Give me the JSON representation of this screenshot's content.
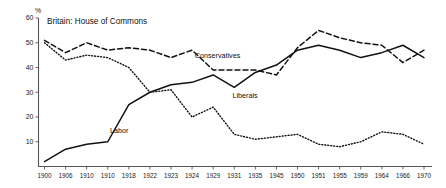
{
  "chart_data": {
    "type": "line",
    "title": "Britain: House of Commons",
    "xlabel": "",
    "ylabel": "%",
    "ylim": [
      0,
      60
    ],
    "yticks": [
      10,
      20,
      30,
      40,
      50,
      60
    ],
    "grid": false,
    "legend_position": "inline-annotations",
    "categories": [
      "1900",
      "1906",
      "1910",
      "1910",
      "1918",
      "1922",
      "1923",
      "1924",
      "1929",
      "1931",
      "1935",
      "1945",
      "1950",
      "1951",
      "1955",
      "1959",
      "1964",
      "1966",
      "1970"
    ],
    "series": [
      {
        "name": "Conservatives",
        "style": "dashed",
        "color": "#111111",
        "values": [
          51,
          46,
          50,
          47,
          48,
          47,
          44,
          47,
          39,
          39,
          39,
          37,
          48,
          55,
          52,
          50,
          49,
          42,
          47
        ]
      },
      {
        "name": "Labor",
        "style": "solid",
        "color": "#111111",
        "values": [
          2,
          7,
          9,
          10,
          25,
          30,
          33,
          34,
          37,
          32,
          38,
          41,
          47,
          49,
          47,
          44,
          46,
          49,
          44
        ]
      },
      {
        "name": "Liberals",
        "style": "dotted",
        "color": "#111111",
        "values": [
          50,
          43,
          45,
          44,
          40,
          30,
          31,
          20,
          24,
          13,
          11,
          12,
          13,
          9,
          8,
          10,
          14,
          13,
          9
        ]
      }
    ],
    "annotations": [
      {
        "text": "Conservatives",
        "x_frac": 0.455,
        "y_value": 44.0
      },
      {
        "text": "Labor",
        "x_frac": 0.205,
        "y_value": 13.5
      },
      {
        "text": "Liberals",
        "x_frac": 0.525,
        "y_value": 27.5
      }
    ]
  },
  "axes": {
    "y_unit_label": "%",
    "y_tick_labels": [
      "60",
      "50",
      "40",
      "30",
      "20",
      "10"
    ],
    "x_tick_labels": [
      "1900",
      "1906",
      "1910",
      "1910",
      "1918",
      "1922",
      "1923",
      "1924",
      "1929",
      "1931",
      "1935",
      "1945",
      "1950",
      "1951",
      "1955",
      "1959",
      "1964",
      "1966",
      "1970"
    ]
  }
}
